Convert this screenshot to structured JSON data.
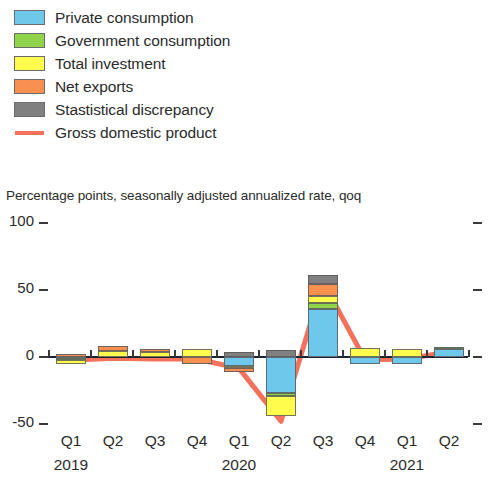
{
  "legend": {
    "items": [
      {
        "label": "Private consumption",
        "color": "#6dc8ec",
        "type": "swatch"
      },
      {
        "label": "Government consumption",
        "color": "#8fd44a",
        "type": "swatch"
      },
      {
        "label": "Total investment",
        "color": "#fffc4e",
        "type": "swatch"
      },
      {
        "label": "Net exports",
        "color": "#f89050",
        "type": "swatch"
      },
      {
        "label": "Stastistical discrepancy",
        "color": "#808080",
        "type": "swatch"
      },
      {
        "label": "Gross domestic product",
        "color": "#f4715c",
        "type": "line"
      }
    ]
  },
  "chart_data": {
    "type": "bar",
    "title": "",
    "subtitle": "Percentage points, seasonally adjusted annualized rate, qoq",
    "xlabel": "",
    "ylabel": "Percentage points, seasonally adjusted annualized rate, qoq",
    "ylim": [
      -60,
      100
    ],
    "yticks": [
      100,
      50,
      0,
      -50
    ],
    "ytick_labels": [
      "100",
      "50",
      "0",
      "-50"
    ],
    "grid": false,
    "stacked": true,
    "legend_position": "top-left",
    "categories": [
      "Q1",
      "Q2",
      "Q3",
      "Q4",
      "Q1",
      "Q2",
      "Q3",
      "Q4",
      "Q1",
      "Q2"
    ],
    "years": [
      {
        "label": "2019",
        "start_index": 0,
        "span": 4
      },
      {
        "label": "2020",
        "start_index": 4,
        "span": 4
      },
      {
        "label": "2021",
        "start_index": 8,
        "span": 2
      }
    ],
    "series": [
      {
        "name": "Private consumption",
        "color": "#6dc8ec",
        "values": [
          -1.0,
          0.0,
          0.0,
          0.0,
          -6.5,
          -27.0,
          36.0,
          -5.5,
          -5.0,
          6.0
        ]
      },
      {
        "name": "Government consumption",
        "color": "#8fd44a",
        "values": [
          -1.5,
          0.0,
          0.0,
          0.0,
          0.0,
          -2.0,
          4.5,
          0.0,
          0.0,
          1.5
        ]
      },
      {
        "name": "Total investment",
        "color": "#fffc4e",
        "values": [
          -2.5,
          4.5,
          3.5,
          6.0,
          -2.0,
          -15.0,
          5.0,
          6.5,
          6.0,
          0.0
        ]
      },
      {
        "name": "Net exports",
        "color": "#f89050",
        "values": [
          2.5,
          4.0,
          2.5,
          -5.0,
          -2.5,
          0.0,
          9.0,
          0.0,
          0.0,
          0.0
        ]
      },
      {
        "name": "Stastistical discrepancy",
        "color": "#808080",
        "values": [
          0.0,
          0.0,
          0.0,
          0.0,
          4.0,
          5.0,
          6.5,
          0.0,
          0.0,
          0.0
        ]
      }
    ],
    "line_series": {
      "name": "Gross domestic product",
      "color": "#f4715c",
      "values": [
        -2.5,
        -1.0,
        -1.5,
        -1.5,
        -8.5,
        -48.0,
        56.0,
        -2.0,
        -1.5,
        4.0
      ]
    }
  }
}
